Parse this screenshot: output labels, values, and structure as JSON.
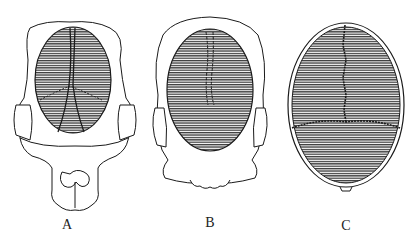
{
  "figure": {
    "panels": [
      {
        "id": "A",
        "label": "A",
        "description": "Skull view with crossed suture lines and lower jaw"
      },
      {
        "id": "B",
        "label": "B",
        "description": "Skull view with faint midline suture"
      },
      {
        "id": "C",
        "label": "C",
        "description": "Skull view with serrated sagittal and transverse sutures"
      }
    ],
    "colors": {
      "stroke": "#1a1a1a",
      "hatch": "#444444",
      "background": "#ffffff"
    }
  }
}
